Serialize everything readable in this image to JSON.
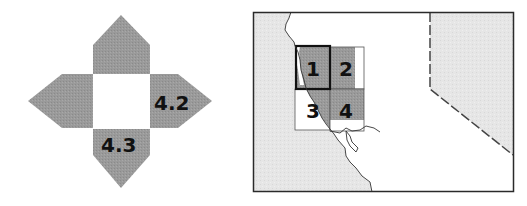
{
  "colors": {
    "arm_fill": "#9a9a9a",
    "land_fill": "#e6e6e6",
    "ocean_fill": "#ffffff",
    "tile_fill": "#9e9e9e",
    "frame_stroke": "#2a2a2a",
    "text": "#111111"
  },
  "compass": {
    "center_label": "",
    "arms": [
      {
        "position": "top",
        "label": ""
      },
      {
        "position": "right",
        "label": "4.2"
      },
      {
        "position": "bottom",
        "label": "4.3"
      },
      {
        "position": "left",
        "label": ""
      }
    ]
  },
  "locator_map": {
    "tiles": [
      {
        "id": "1",
        "label": "1",
        "selected": true,
        "shaded": true
      },
      {
        "id": "2",
        "label": "2",
        "selected": false,
        "shaded": true
      },
      {
        "id": "3",
        "label": "3",
        "selected": false,
        "shaded": false
      },
      {
        "id": "4",
        "label": "4",
        "selected": false,
        "shaded": true
      }
    ]
  }
}
